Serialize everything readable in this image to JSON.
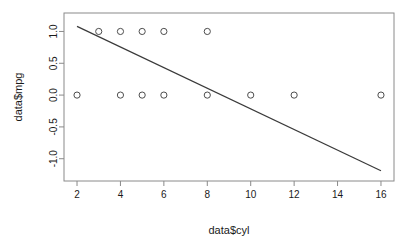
{
  "chart_data": {
    "type": "scatter",
    "title": "",
    "subtitle": "",
    "xlabel": "data$cyl",
    "ylabel": "data$mpg",
    "xlim": [
      1.4,
      16.6
    ],
    "ylim": [
      -1.35,
      1.29
    ],
    "grid": false,
    "legend": "none",
    "xticks": [
      2,
      4,
      6,
      8,
      10,
      12,
      14,
      16
    ],
    "xtick_labels": [
      "2",
      "4",
      "6",
      "8",
      "10",
      "12",
      "14",
      "16"
    ],
    "yticks": [
      1.0,
      0.5,
      0.0,
      -0.5,
      -1.0
    ],
    "ytick_labels": [
      "1.0",
      "0.5",
      "0.0",
      "-0.5",
      "-1.0"
    ],
    "marker": "open-circle",
    "marker_color": "#4d4d4d",
    "points": [
      {
        "x": 2,
        "y": 0
      },
      {
        "x": 3,
        "y": 1
      },
      {
        "x": 4,
        "y": 1
      },
      {
        "x": 4,
        "y": 0
      },
      {
        "x": 5,
        "y": 1
      },
      {
        "x": 5,
        "y": 0
      },
      {
        "x": 6,
        "y": 1
      },
      {
        "x": 6,
        "y": 0
      },
      {
        "x": 8,
        "y": 1
      },
      {
        "x": 8,
        "y": 0
      },
      {
        "x": 10,
        "y": 0
      },
      {
        "x": 12,
        "y": 0
      },
      {
        "x": 16,
        "y": 0
      }
    ],
    "series": [
      {
        "name": "observations",
        "x": [
          2,
          3,
          4,
          4,
          5,
          5,
          6,
          6,
          8,
          8,
          10,
          12,
          16
        ],
        "values": [
          0,
          1,
          1,
          0,
          1,
          0,
          1,
          0,
          1,
          0,
          0,
          0,
          0
        ]
      }
    ],
    "trendline": {
      "type": "line",
      "color": "#3a3a3a",
      "x": [
        2,
        16
      ],
      "values": [
        1.08,
        -1.19
      ],
      "slope": -0.1621,
      "intercept": 1.4043
    }
  }
}
